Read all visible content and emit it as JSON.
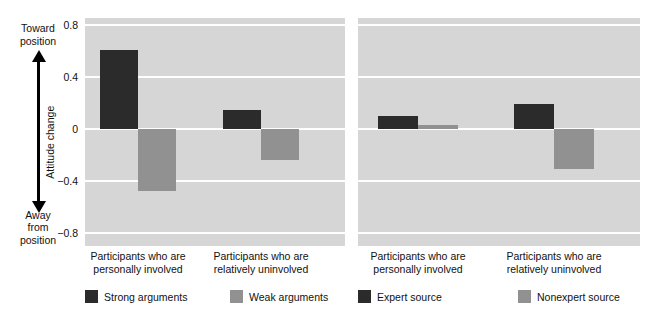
{
  "yaxis": {
    "top_label": "Toward\nposition",
    "top_label_line1": "Toward",
    "top_label_line2": "position",
    "bottom_label_line1": "Away",
    "bottom_label_line2": "from",
    "bottom_label_line3": "position",
    "title": "Attitude change",
    "ticks": [
      "0.8",
      "0.4",
      "0",
      "−0.4",
      "−0.8"
    ]
  },
  "panels": [
    {
      "id": "left",
      "group_labels": [
        "Participants who are personally involved",
        "Participants who are relatively uninvolved"
      ],
      "legend": [
        {
          "label": "Strong arguments",
          "color": "#2b2b2b"
        },
        {
          "label": "Weak arguments",
          "color": "#919191"
        }
      ]
    },
    {
      "id": "right",
      "group_labels": [
        "Participants who are personally involved",
        "Participants who are relatively uninvolved"
      ],
      "legend": [
        {
          "label": "Expert source",
          "color": "#2b2b2b"
        },
        {
          "label": "Nonexpert source",
          "color": "#919191"
        }
      ]
    }
  ],
  "caption_ghost": "",
  "chart_data": [
    {
      "type": "bar",
      "title": "",
      "panel": "left",
      "xlabel": "",
      "ylabel": "Attitude change",
      "ylim": [
        -0.8,
        0.8
      ],
      "yticks": [
        0.8,
        0.4,
        0,
        -0.4,
        -0.8
      ],
      "grid": true,
      "legend_position": "below",
      "categories": [
        "Participants who are personally involved",
        "Participants who are relatively uninvolved"
      ],
      "series": [
        {
          "name": "Strong arguments",
          "color": "#2b2b2b",
          "values": [
            0.61,
            0.15
          ]
        },
        {
          "name": "Weak arguments",
          "color": "#919191",
          "values": [
            -0.48,
            -0.24
          ]
        }
      ]
    },
    {
      "type": "bar",
      "title": "",
      "panel": "right",
      "xlabel": "",
      "ylabel": "Attitude change",
      "ylim": [
        -0.8,
        0.8
      ],
      "yticks": [
        0.8,
        0.4,
        0,
        -0.4,
        -0.8
      ],
      "grid": true,
      "legend_position": "below",
      "categories": [
        "Participants who are personally involved",
        "Participants who are relatively uninvolved"
      ],
      "series": [
        {
          "name": "Expert source",
          "color": "#2b2b2b",
          "values": [
            0.1,
            0.19
          ]
        },
        {
          "name": "Nonexpert source",
          "color": "#919191",
          "values": [
            0.03,
            -0.31
          ]
        }
      ]
    }
  ],
  "style": {
    "plot_background": "#d6d6d6",
    "gridline_color": "#ffffff",
    "dark_series_color": "#2b2b2b",
    "light_series_color": "#919191"
  }
}
